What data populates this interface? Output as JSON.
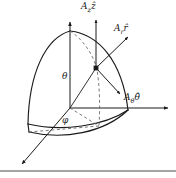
{
  "figure": {
    "background_color": "#ffffff",
    "stroke_color": "#1a1a1a",
    "labels": {
      "z_component": "A",
      "z_component_sub": "z",
      "z_component_hat": "ẑ",
      "r_component": "A",
      "r_component_sub": "r",
      "r_component_hat": "r̂",
      "theta_component": "A",
      "theta_component_sub": "θ",
      "theta_component_hat": "θ̂",
      "polar_angle": "θ",
      "azimuth_angle": "φ"
    },
    "geometry": {
      "origin": [
        70,
        108
      ],
      "point": [
        96,
        68
      ],
      "z_axis_tip": [
        70,
        20
      ],
      "x_axis_tip": [
        170,
        108
      ],
      "y_axis_tip": [
        20,
        166
      ],
      "az_arrow_tip": [
        96,
        18
      ],
      "ar_arrow_tip": [
        130,
        35
      ],
      "atheta_arrow_tip": [
        122,
        96
      ]
    },
    "footer_rule_y": 171
  }
}
